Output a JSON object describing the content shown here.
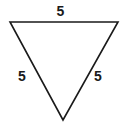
{
  "figure": {
    "kind": "equilateral-triangle-diagram",
    "orientation": "pointing-down",
    "background_color": "#ffffff",
    "stroke_color": "#1a1a1a",
    "stroke_width": 1.6,
    "vertices": {
      "top_left": [
        10,
        22
      ],
      "top_right": [
        118,
        22
      ],
      "bottom_apex": [
        63,
        120
      ]
    },
    "labels": {
      "top": "5",
      "left": "5",
      "right": "5"
    },
    "label_color": "#1a1a1a"
  }
}
